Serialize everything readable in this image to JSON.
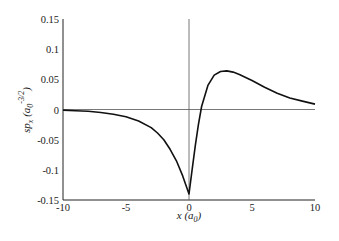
{
  "chart_data": {
    "type": "line",
    "title": "",
    "xlabel": "x (a0)",
    "ylabel": "sp_x (a0^-3/2)",
    "xlim": [
      -10,
      10
    ],
    "ylim": [
      -0.15,
      0.15
    ],
    "x_ticks": [
      -10,
      -5,
      0,
      5,
      10
    ],
    "x_tick_labels": [
      "-10",
      "-5",
      "0",
      "5",
      "10"
    ],
    "y_ticks": [
      0.15,
      0.1,
      0.05,
      0,
      -0.05,
      -0.1,
      -0.15
    ],
    "y_tick_labels": [
      "0.15",
      "0.1",
      "0.05",
      "0",
      "-0.05",
      "-0.1",
      "-0.15"
    ],
    "grid": false,
    "legend": null,
    "reference_lines": {
      "horizontal_zero": true,
      "vertical_zero": true
    },
    "series": [
      {
        "name": "sp_x",
        "x": [
          -10,
          -9,
          -8,
          -7,
          -6,
          -5,
          -4,
          -3,
          -2.5,
          -2,
          -1.5,
          -1,
          -0.5,
          0,
          0.25,
          0.5,
          0.75,
          1,
          1.5,
          2,
          2.5,
          3,
          3.5,
          4,
          5,
          6,
          7,
          8,
          9,
          10
        ],
        "values": [
          -0.001,
          -0.002,
          -0.003,
          -0.005,
          -0.008,
          -0.012,
          -0.019,
          -0.03,
          -0.039,
          -0.05,
          -0.066,
          -0.085,
          -0.11,
          -0.14,
          -0.1,
          -0.06,
          -0.025,
          0.005,
          0.04,
          0.057,
          0.063,
          0.064,
          0.062,
          0.058,
          0.048,
          0.037,
          0.027,
          0.019,
          0.014,
          0.009
        ]
      }
    ]
  },
  "labels": {
    "x_axis_title_var": "x",
    "x_axis_title_unit_base": "a",
    "x_axis_title_unit_sub": "0",
    "y_axis_title_var": "sp",
    "y_axis_title_var_sub": "x",
    "y_axis_title_unit_base": "a",
    "y_axis_title_unit_sub": "0",
    "y_axis_title_unit_sup": "-3/2"
  }
}
